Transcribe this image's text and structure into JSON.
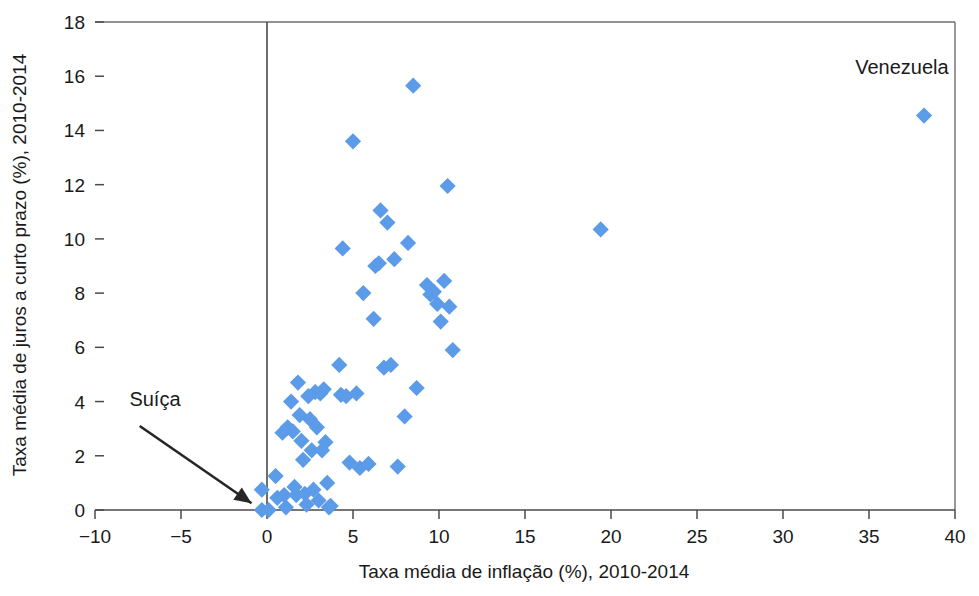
{
  "chart_data": {
    "type": "scatter",
    "title": "",
    "xlabel": "Taxa média de inflação (%), 2010-2014",
    "ylabel": "Taxa média de juros a curto prazo (%), 2010-2014",
    "xlim": [
      -10,
      40
    ],
    "ylim": [
      0,
      18
    ],
    "xticks": [
      -10,
      -5,
      0,
      5,
      10,
      15,
      20,
      25,
      30,
      35,
      40
    ],
    "xtick_labels": [
      "−10",
      "−5",
      "0",
      "5",
      "10",
      "15",
      "20",
      "25",
      "30",
      "35",
      "40"
    ],
    "yticks": [
      0,
      2,
      4,
      6,
      8,
      10,
      12,
      14,
      16,
      18
    ],
    "ytick_labels": [
      "0",
      "2",
      "4",
      "6",
      "8",
      "10",
      "12",
      "14",
      "16",
      "18"
    ],
    "grid": false,
    "legend": null,
    "marker": {
      "shape": "diamond",
      "color": "#5b9be8",
      "size": 11
    },
    "series": [
      {
        "name": "Países",
        "points": [
          [
            -0.3,
            0.75
          ],
          [
            -0.3,
            0.0
          ],
          [
            0.1,
            0.0
          ],
          [
            0.5,
            1.25
          ],
          [
            0.6,
            0.45
          ],
          [
            0.9,
            2.85
          ],
          [
            1.0,
            0.55
          ],
          [
            1.1,
            0.1
          ],
          [
            1.2,
            3.05
          ],
          [
            1.4,
            4.0
          ],
          [
            1.5,
            2.9
          ],
          [
            1.6,
            0.85
          ],
          [
            1.7,
            0.55
          ],
          [
            1.8,
            4.7
          ],
          [
            1.9,
            3.5
          ],
          [
            2.0,
            2.55
          ],
          [
            2.1,
            1.85
          ],
          [
            2.2,
            0.6
          ],
          [
            2.3,
            0.2
          ],
          [
            2.4,
            4.2
          ],
          [
            2.5,
            3.35
          ],
          [
            2.6,
            2.2
          ],
          [
            2.7,
            0.75
          ],
          [
            2.8,
            4.35
          ],
          [
            2.9,
            3.05
          ],
          [
            3.0,
            0.35
          ],
          [
            3.1,
            4.3
          ],
          [
            3.2,
            2.2
          ],
          [
            3.3,
            4.45
          ],
          [
            3.4,
            2.5
          ],
          [
            3.5,
            1.0
          ],
          [
            3.6,
            0.1
          ],
          [
            3.7,
            0.15
          ],
          [
            4.2,
            5.35
          ],
          [
            4.3,
            4.25
          ],
          [
            4.4,
            9.65
          ],
          [
            4.6,
            4.2
          ],
          [
            4.8,
            1.75
          ],
          [
            5.0,
            13.6
          ],
          [
            5.2,
            4.3
          ],
          [
            5.4,
            1.55
          ],
          [
            5.6,
            8.0
          ],
          [
            5.9,
            1.7
          ],
          [
            6.2,
            7.05
          ],
          [
            6.3,
            9.0
          ],
          [
            6.5,
            9.1
          ],
          [
            6.6,
            11.05
          ],
          [
            6.8,
            5.25
          ],
          [
            7.0,
            10.6
          ],
          [
            7.2,
            5.35
          ],
          [
            7.4,
            9.25
          ],
          [
            7.6,
            1.6
          ],
          [
            8.0,
            3.45
          ],
          [
            8.2,
            9.85
          ],
          [
            8.5,
            15.65
          ],
          [
            8.7,
            4.5
          ],
          [
            9.3,
            8.3
          ],
          [
            9.5,
            7.95
          ],
          [
            9.7,
            8.05
          ],
          [
            9.9,
            7.6
          ],
          [
            10.1,
            6.95
          ],
          [
            10.3,
            8.45
          ],
          [
            10.5,
            11.95
          ],
          [
            10.6,
            7.5
          ],
          [
            10.8,
            5.9
          ],
          [
            19.4,
            10.35
          ],
          [
            38.2,
            14.55
          ]
        ]
      }
    ],
    "annotations": [
      {
        "label": "Venezuela",
        "label_x": 34.2,
        "label_y": 16.1,
        "has_arrow": false
      },
      {
        "label": "Suíça",
        "label_x": -8.0,
        "label_y": 3.85,
        "has_arrow": true,
        "arrow_from_x": -7.4,
        "arrow_from_y": 3.1,
        "arrow_to_x": -0.9,
        "arrow_to_y": 0.25
      }
    ]
  }
}
